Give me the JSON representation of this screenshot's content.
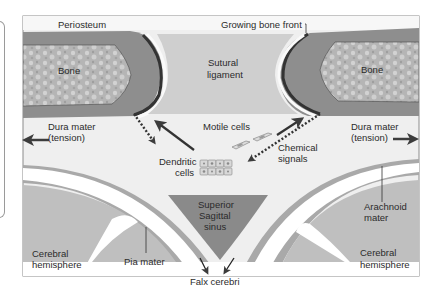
{
  "colors": {
    "frame": "#8c8c8c",
    "background": "#eeeeee",
    "periosteum": "#8e8e8e",
    "bone": "#b9b9b9",
    "ligament": "#cdcdcd",
    "bone_front": "#3a3a3a",
    "dura": "#ffffff",
    "arachnoid": "#a9a9a9",
    "hemisphere": "#bfbfbf",
    "sinus": "#8a8a8a",
    "arrow": "#3c3c3c"
  },
  "labels": {
    "periosteum": "Periosteum",
    "growing_bone_front": "Growing bone front",
    "bone_left": "Bone",
    "bone_right": "Bone",
    "sutural_1": "Sutural",
    "sutural_2": "ligament",
    "dura_left_1": "Dura mater",
    "dura_left_2": "(tension)",
    "dura_right_1": "Dura mater",
    "dura_right_2": "(tension)",
    "motile_cells": "Motile cells",
    "chemical_1": "Chemical",
    "chemical_2": "signals",
    "dendritic_1": "Dendritic",
    "dendritic_2": "cells",
    "sinus_1": "Superior",
    "sinus_2": "Sagittal",
    "sinus_3": "sinus",
    "arachnoid_1": "Arachnoid",
    "arachnoid_2": "mater",
    "cerebral_left_1": "Cerebral",
    "cerebral_left_2": "hemisphere",
    "cerebral_right_1": "Cerebral",
    "cerebral_right_2": "hemisphere",
    "pia_mater": "Pia mater",
    "falx_cerebri": "Falx cerebri"
  }
}
